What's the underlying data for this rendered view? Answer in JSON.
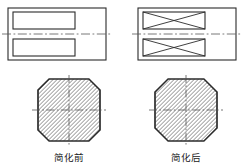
{
  "figure": {
    "background_color": "#ffffff",
    "line_color": "#2b2b2b",
    "hatch_color": "#4a4a4a",
    "centerline_color": "#555555",
    "panels": [
      {
        "id": "left",
        "caption": "简化前",
        "front_view": {
          "name": "front-view-before",
          "outer_rect": {
            "x": 8,
            "y": 8,
            "width": 98,
            "height": 52
          },
          "slots": [
            {
              "x": 13,
              "y": 12,
              "width": 62,
              "height": 17,
              "crossed": false
            },
            {
              "x": 13,
              "y": 39,
              "width": 62,
              "height": 17,
              "crossed": false
            }
          ],
          "centerline": {
            "x1": 2,
            "y1": 34,
            "x2": 112,
            "y2": 34
          }
        },
        "section_view": {
          "name": "section-view-before",
          "center_x": 69,
          "center_y": 110,
          "radius": 31,
          "corner_cut": 11,
          "hatch_angle_deg": 45,
          "hatch_spacing": 4,
          "centerline_h": {
            "x1": 32,
            "y1": 110,
            "x2": 106,
            "y2": 110
          },
          "centerline_v": {
            "x1": 69,
            "y1": 75,
            "x2": 69,
            "y2": 146
          }
        }
      },
      {
        "id": "right",
        "caption": "简化后",
        "front_view": {
          "name": "front-view-after",
          "outer_rect": {
            "x": 138,
            "y": 8,
            "width": 98,
            "height": 52
          },
          "slots": [
            {
              "x": 143,
              "y": 12,
              "width": 62,
              "height": 17,
              "crossed": true
            },
            {
              "x": 143,
              "y": 39,
              "width": 62,
              "height": 17,
              "crossed": true
            }
          ],
          "centerline": {
            "x1": 132,
            "y1": 34,
            "x2": 242,
            "y2": 34
          }
        },
        "section_view": {
          "name": "section-view-after",
          "center_x": 186,
          "center_y": 110,
          "radius": 31,
          "corner_cut": 13,
          "hatch_angle_deg": 45,
          "hatch_spacing": 4,
          "centerline_h": {
            "x1": 149,
            "y1": 110,
            "x2": 223,
            "y2": 110
          },
          "centerline_v": {
            "x1": 186,
            "y1": 75,
            "x2": 186,
            "y2": 146
          }
        }
      }
    ],
    "captions": {
      "left_label": "简化前",
      "right_label": "简化后",
      "left_x": 69,
      "right_x": 186,
      "baseline_y": 161
    }
  }
}
